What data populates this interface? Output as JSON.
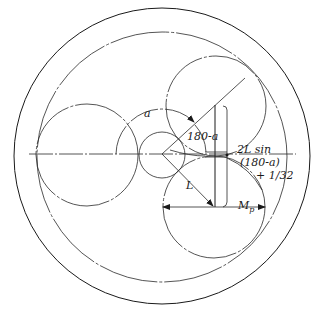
{
  "diagram": {
    "colors": {
      "line": "#1a1a1a",
      "background": "#ffffff"
    },
    "labels": {
      "angle_a": "a",
      "angle_supplement": "180-a",
      "length_L": "L",
      "formula_line1": "2L sin",
      "formula_line2": "(180-a)",
      "formula_line3": "+ 1/32",
      "measure_mp": "M",
      "measure_mp_sub": "p"
    },
    "elements": [
      {
        "name": "outer-ring-circle",
        "cx": 162,
        "cy": 156,
        "r": 148
      },
      {
        "name": "ring-gear-pitch-circle",
        "cx": 162,
        "cy": 157,
        "r": 125
      },
      {
        "name": "sun-gear",
        "cx": 162,
        "cy": 155,
        "r": 23
      },
      {
        "name": "planet-left",
        "cx": 87,
        "cy": 155,
        "r": 51
      },
      {
        "name": "planet-upper-right",
        "cx": 216,
        "cy": 106,
        "r": 50
      },
      {
        "name": "planet-lower-right",
        "cx": 214,
        "cy": 207,
        "r": 51
      }
    ]
  }
}
